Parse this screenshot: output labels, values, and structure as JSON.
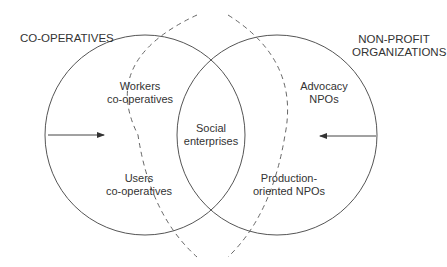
{
  "diagram": {
    "left_set": {
      "title": "CO-OPERATIVES",
      "items": [
        "Workers co-operatives",
        "Users co-operatives"
      ]
    },
    "right_set": {
      "title_line1": "NON-PROFIT",
      "title_line2": "ORGANIZATIONS",
      "items": [
        "Advocacy NPOs",
        "Production-oriented NPOs"
      ]
    },
    "intersection": {
      "line1": "Social",
      "line2": "enterprises"
    },
    "labels": {
      "workers_l1": "Workers",
      "workers_l2": "co-operatives",
      "users_l1": "Users",
      "users_l2": "co-operatives",
      "advocacy_l1": "Advocacy",
      "advocacy_l2": "NPOs",
      "production_l1": "Production-",
      "production_l2": "oriented NPOs"
    },
    "colors": {
      "line": "#555555",
      "text": "#333333"
    }
  }
}
